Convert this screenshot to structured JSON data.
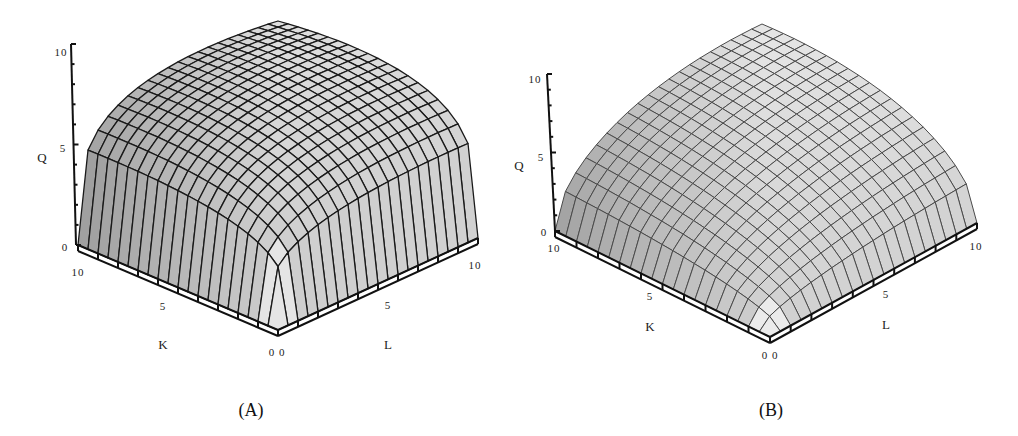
{
  "chart_data": [
    {
      "type": "surface3d",
      "panel": "A",
      "caption": "(A)",
      "title": "",
      "function": "Q = 10·(K/10)^0.25·(L/10)^0.25",
      "xlabel": "K",
      "ylabel": "L",
      "zlabel": "Q",
      "xlim": [
        0,
        10
      ],
      "ylim": [
        0,
        10
      ],
      "zlim": [
        0,
        10
      ],
      "x_ticks": [
        "10",
        "5",
        "0"
      ],
      "y_ticks": [
        "0",
        "5",
        "10"
      ],
      "z_ticks": [
        "0",
        "5",
        "10"
      ],
      "grid_divisions": 20,
      "exponents": {
        "K": 0.25,
        "L": 0.25
      },
      "style": {
        "mesh_color": "#1a1a1a",
        "mesh_width": 1.3,
        "surface_light": "#eeeeee",
        "surface_dark": "#8f8f8f"
      },
      "geometry": {
        "origin": [
          278,
          330
        ],
        "k_end": [
          78,
          245
        ],
        "l_end": [
          478,
          238
        ],
        "heights": {
          "front": 250,
          "k_corner": 194,
          "l_corner": 194,
          "back": 132
        },
        "q_axis_top": [
          71,
          44
        ],
        "q_axis_bottom": [
          76,
          245
        ]
      },
      "labels": {
        "q_ticks": [
          {
            "text": "10",
            "x": 61,
            "y": 52
          },
          {
            "text": "5",
            "x": 63,
            "y": 148
          },
          {
            "text": "0",
            "x": 65,
            "y": 247
          }
        ],
        "q_title": {
          "text": "Q",
          "x": 42,
          "y": 158
        },
        "k_ticks": [
          {
            "text": "10",
            "x": 78,
            "y": 272
          },
          {
            "text": "5",
            "x": 163,
            "y": 306
          }
        ],
        "k_title": {
          "text": "K",
          "x": 163,
          "y": 345
        },
        "origin_label": {
          "text": "0 0",
          "x": 277,
          "y": 352
        },
        "l_ticks": [
          {
            "text": "5",
            "x": 388,
            "y": 305
          },
          {
            "text": "10",
            "x": 475,
            "y": 265
          }
        ],
        "l_title": {
          "text": "L",
          "x": 388,
          "y": 345
        },
        "caption_pos": {
          "x": 251,
          "y": 410
        }
      }
    },
    {
      "type": "surface3d",
      "panel": "B",
      "caption": "(B)",
      "title": "",
      "function": "Q = 10·(K/10)^0.5·(L/10)^0.5",
      "xlabel": "K",
      "ylabel": "L",
      "zlabel": "Q",
      "xlim": [
        0,
        10
      ],
      "ylim": [
        0,
        10
      ],
      "zlim": [
        0,
        10
      ],
      "x_ticks": [
        "10",
        "5",
        "0"
      ],
      "y_ticks": [
        "0",
        "5",
        "10"
      ],
      "z_ticks": [
        "0",
        "5",
        "10"
      ],
      "grid_divisions": 20,
      "exponents": {
        "K": 0.5,
        "L": 0.5
      },
      "style": {
        "mesh_color": "#4a4a4a",
        "mesh_width": 1.0,
        "surface_light": "#f4f4f4",
        "surface_dark": "#9a9a9a"
      },
      "geometry": {
        "origin": [
          261,
          337
        ],
        "k_end": [
          46,
          231
        ],
        "l_end": [
          468,
          223
        ],
        "heights": {
          "front": 200,
          "k_corner": 154,
          "l_corner": 154,
          "back": 93
        },
        "q_axis_top": [
          38,
          74
        ],
        "q_axis_bottom": [
          46,
          231
        ]
      },
      "labels": {
        "q_ticks": [
          {
            "text": "10",
            "x": 26,
            "y": 79
          },
          {
            "text": "5",
            "x": 32,
            "y": 157
          },
          {
            "text": "0",
            "x": 35,
            "y": 232
          }
        ],
        "q_title": {
          "text": "Q",
          "x": 10,
          "y": 166
        },
        "k_ticks": [
          {
            "text": "10",
            "x": 45,
            "y": 248
          },
          {
            "text": "5",
            "x": 141,
            "y": 296
          }
        ],
        "k_title": {
          "text": "K",
          "x": 141,
          "y": 327
        },
        "origin_label": {
          "text": "0 0",
          "x": 261,
          "y": 355
        },
        "l_ticks": [
          {
            "text": "5",
            "x": 377,
            "y": 294
          },
          {
            "text": "10",
            "x": 467,
            "y": 246
          }
        ],
        "l_title": {
          "text": "L",
          "x": 377,
          "y": 325
        },
        "caption_pos": {
          "x": 262,
          "y": 410
        }
      }
    }
  ]
}
